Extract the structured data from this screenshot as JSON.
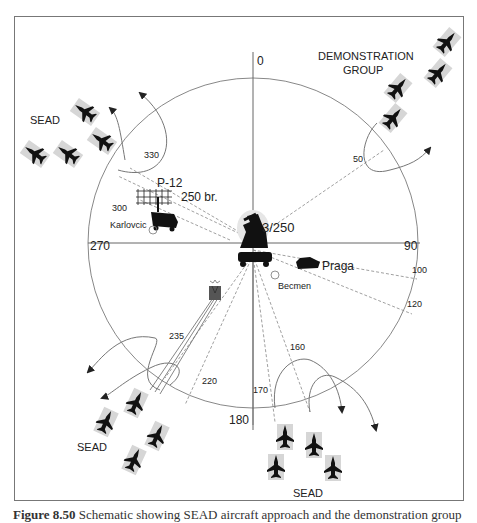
{
  "figure": {
    "bearings": {
      "north": "0",
      "east": "90",
      "south": "180",
      "west": "270"
    },
    "radial_labels": [
      {
        "id": "330",
        "text": "330"
      },
      {
        "id": "300",
        "text": "300"
      },
      {
        "id": "50",
        "text": "50"
      },
      {
        "id": "100",
        "text": "100"
      },
      {
        "id": "120",
        "text": "120"
      },
      {
        "id": "160",
        "text": "160"
      },
      {
        "id": "170",
        "text": "170"
      },
      {
        "id": "220",
        "text": "220"
      },
      {
        "id": "235",
        "text": "235"
      }
    ],
    "units": {
      "center_system": "3/250",
      "radar": "P-12",
      "radar_brigade": "250 br.",
      "karlovcic": "Karlovcic",
      "praga": "Praga",
      "becmen": "Becmen"
    },
    "groups": {
      "sead_northwest": "SEAD",
      "demonstration_line1": "DEMONSTRATION",
      "demonstration_line2": "GROUP",
      "sead_southwest": "SEAD",
      "sead_south": "SEAD"
    },
    "icons": {
      "aircraft": "fighter-jet-icon",
      "sam_launcher": "sam-launcher-icon",
      "radar_antenna": "radar-antenna-icon",
      "vehicle": "truck-icon",
      "tank": "tank-icon",
      "position_marker": "circle-marker-icon",
      "small_radar": "small-radar-icon"
    },
    "caption": {
      "prefix": "Figure 8.50",
      "text": " Schematic showing SEAD aircraft approach and the demonstration group"
    }
  }
}
